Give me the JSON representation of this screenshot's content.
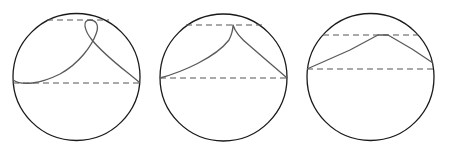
{
  "figure": {
    "width": 449,
    "height": 151,
    "panels": [
      {
        "id": "panel-1",
        "circle": {
          "cx": 76.5,
          "cy": 77,
          "r": 63.5
        },
        "upper_dashed_line": {
          "y": 20,
          "x1": 47,
          "x2": 109
        },
        "lower_dashed_line": {
          "y": 83,
          "x1": 13,
          "x2": 140
        },
        "curve_path": "M 13 80 C 22 86, 40 84, 60 74 C 80 63, 92 45, 96 34 C 100 24, 95 20, 90 20 C 82 20, 84 30, 92 40 C 107 58, 125 70, 140 83",
        "description": "looped trajectory"
      },
      {
        "id": "panel-2",
        "circle": {
          "cx": 223.5,
          "cy": 77.5,
          "r": 63.5
        },
        "upper_dashed_line": {
          "y": 25,
          "x1": 186,
          "x2": 262
        },
        "lower_dashed_line": {
          "y": 78,
          "x1": 160,
          "x2": 287
        },
        "curve_path": "M 160 78 C 182 72, 215 58, 229 40 C 232 34, 233 28, 233 25 C 235 32, 240 38, 250 46 C 266 60, 278 70, 287 78",
        "description": "cusped trajectory"
      },
      {
        "id": "panel-3",
        "circle": {
          "cx": 370.5,
          "cy": 77,
          "r": 63.5
        },
        "upper_dashed_line": {
          "y": 35,
          "x1": 323,
          "x2": 418
        },
        "lower_dashed_line": {
          "y": 69,
          "x1": 307,
          "x2": 434
        },
        "curve_path": "M 307 69 L 350 50 L 378 35 L 388 35 L 412 49 L 433 63",
        "description": "smooth arch trajectory"
      }
    ],
    "colors": {
      "circle": "#1a1a1a",
      "dashed": "#555555",
      "curve": "#5a5a5a",
      "background": "#ffffff"
    }
  }
}
